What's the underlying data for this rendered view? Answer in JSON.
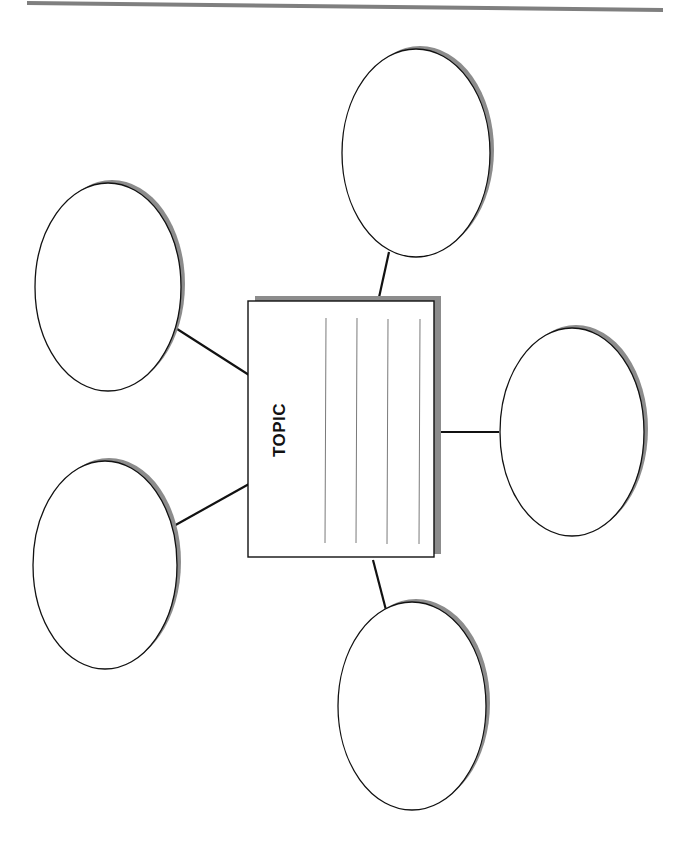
{
  "diagram": {
    "type": "concept-web",
    "orientation": "rotated-90-ccw",
    "topic": {
      "label": "TOPIC",
      "ruled_lines": 4
    },
    "bubbles": [
      {
        "id": "top-right",
        "text": ""
      },
      {
        "id": "upper-left",
        "text": ""
      },
      {
        "id": "lower-left",
        "text": ""
      },
      {
        "id": "right",
        "text": ""
      },
      {
        "id": "bottom",
        "text": ""
      }
    ],
    "colors": {
      "stroke": "#111111",
      "shadow": "#8c8c8c",
      "rule_line": "#7a7a7a",
      "header_rule": "#7f7f7f",
      "background": "#ffffff"
    }
  }
}
